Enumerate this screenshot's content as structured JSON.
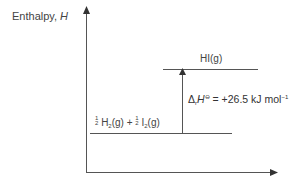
{
  "diagram": {
    "type": "enthalpy-level-diagram",
    "y_axis": {
      "label_text": "Enthalpy, ",
      "label_symbol": "H"
    },
    "x_axis": {
      "label": ""
    },
    "upper_level": {
      "label": "HI(g)"
    },
    "lower_level": {
      "label_parts": [
        "1",
        "2",
        "H",
        "2",
        "(g) + ",
        "1",
        "2",
        "I",
        "2",
        "(g)"
      ]
    },
    "enthalpy_change": {
      "delta": "Δ",
      "subscript": "r",
      "symbol": "H",
      "standard": "⊖",
      "equals": " = ",
      "value": "+26.5",
      "unit": "kJ mol",
      "unit_exp": "−1"
    },
    "colors": {
      "lines": "#555555",
      "text": "#3a3a3a"
    }
  }
}
